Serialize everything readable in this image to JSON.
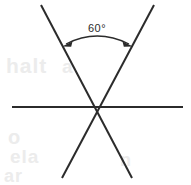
{
  "figure": {
    "background_color": "#ffffff",
    "stroke_color": "#2b2b2b",
    "stroke_width": 2,
    "width": 191,
    "height": 185,
    "intersection": {
      "x": 97,
      "y": 107
    },
    "lines": [
      {
        "name": "horizontal-line",
        "x1": 12,
        "y1": 107,
        "x2": 183,
        "y2": 107
      },
      {
        "name": "diagonal-line-left-to-right",
        "x1": 41,
        "y1": 5,
        "x2": 132,
        "y2": 178
      },
      {
        "name": "diagonal-line-right-to-left",
        "x1": 154,
        "y1": 5,
        "x2": 62,
        "y2": 178
      }
    ],
    "angle_marker": {
      "name": "angle-arc-60",
      "label": "60°",
      "label_x": 97,
      "label_y": 32,
      "arc_start_x": 63,
      "arc_start_y": 45,
      "arc_end_x": 132,
      "arc_end_y": 45,
      "arc_apex_y": 39,
      "value": 60,
      "unit": "degrees",
      "arrowheads": [
        "start",
        "end"
      ],
      "arrow_color": "#2b2b2b"
    },
    "ghost_artifacts": [
      {
        "text": "halt",
        "x": 6,
        "y": 54,
        "size": 21
      },
      {
        "text": "a",
        "x": 62,
        "y": 56,
        "size": 19
      },
      {
        "text": "o",
        "x": 8,
        "y": 126,
        "size": 20
      },
      {
        "text": "ela",
        "x": 10,
        "y": 146,
        "size": 19
      },
      {
        "text": "ar",
        "x": 4,
        "y": 166,
        "size": 18
      },
      {
        "text": "n",
        "x": 120,
        "y": 150,
        "size": 18
      }
    ]
  }
}
